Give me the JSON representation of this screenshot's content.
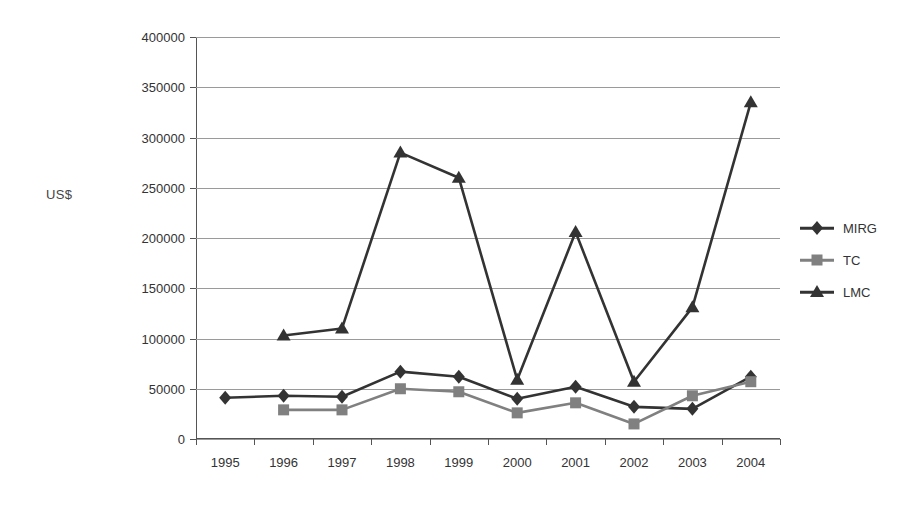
{
  "chart_data": {
    "type": "line",
    "title": "",
    "xlabel": "",
    "ylabel": "US$",
    "categories": [
      "1995",
      "1996",
      "1997",
      "1998",
      "1999",
      "2000",
      "2001",
      "2002",
      "2003",
      "2004"
    ],
    "ylim": [
      0,
      400000
    ],
    "ytick_labels": [
      "0",
      "50000",
      "100000",
      "150000",
      "200000",
      "250000",
      "300000",
      "350000",
      "400000"
    ],
    "ytick_values": [
      0,
      50000,
      100000,
      150000,
      200000,
      250000,
      300000,
      350000,
      400000
    ],
    "grid": true,
    "legend_position": "right",
    "series": [
      {
        "name": "MIRG",
        "marker": "diamond",
        "color": "#333333",
        "values": [
          41000,
          43000,
          42000,
          67000,
          62000,
          40000,
          52000,
          32000,
          30000,
          62000
        ]
      },
      {
        "name": "TC",
        "marker": "square",
        "color": "#808080",
        "values": [
          null,
          29000,
          29000,
          50000,
          47000,
          26000,
          36000,
          15000,
          43000,
          57000
        ]
      },
      {
        "name": "LMC",
        "marker": "triangle",
        "color": "#333333",
        "values": [
          null,
          103000,
          110000,
          285000,
          260000,
          59000,
          206000,
          57000,
          131000,
          335000
        ]
      }
    ]
  },
  "axis": {
    "y_title": "US$"
  },
  "legend": {
    "items": [
      {
        "label": "MIRG"
      },
      {
        "label": "TC"
      },
      {
        "label": "LMC"
      }
    ]
  }
}
